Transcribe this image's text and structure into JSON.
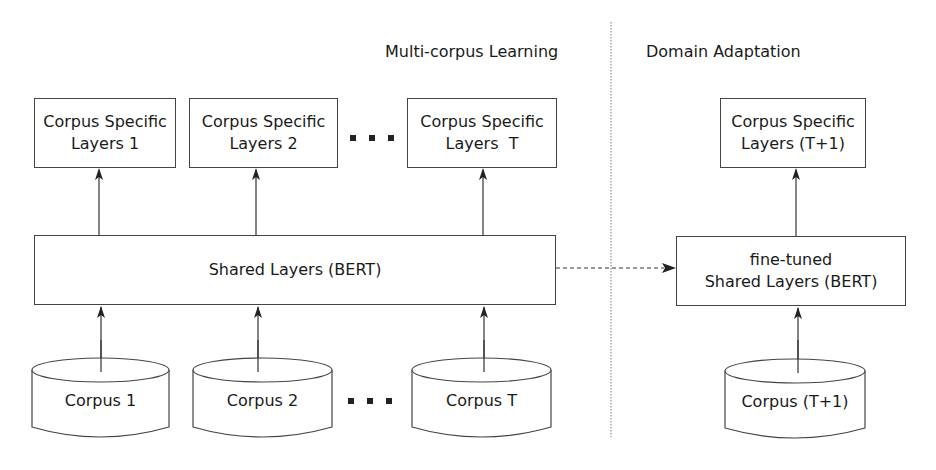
{
  "sections": {
    "left_title": "Multi-corpus Learning",
    "right_title": "Domain Adaptation"
  },
  "top_boxes": [
    {
      "line1": "Corpus Specific",
      "line2": "Layers 1"
    },
    {
      "line1": "Corpus Specific",
      "line2": "Layers 2"
    },
    {
      "line1": "Corpus Specific",
      "line2": "Layers  T"
    },
    {
      "line1": "Corpus Specific",
      "line2": "Layers (T+1)"
    }
  ],
  "shared": {
    "label": "Shared Layers (BERT)"
  },
  "fine_tuned": {
    "line1": "fine-tuned",
    "line2": "Shared Layers (BERT)"
  },
  "corpora": [
    {
      "label": "Corpus 1"
    },
    {
      "label": "Corpus 2"
    },
    {
      "label": "Corpus T"
    },
    {
      "label": "Corpus (T+1)"
    }
  ],
  "ellipsis": "..."
}
